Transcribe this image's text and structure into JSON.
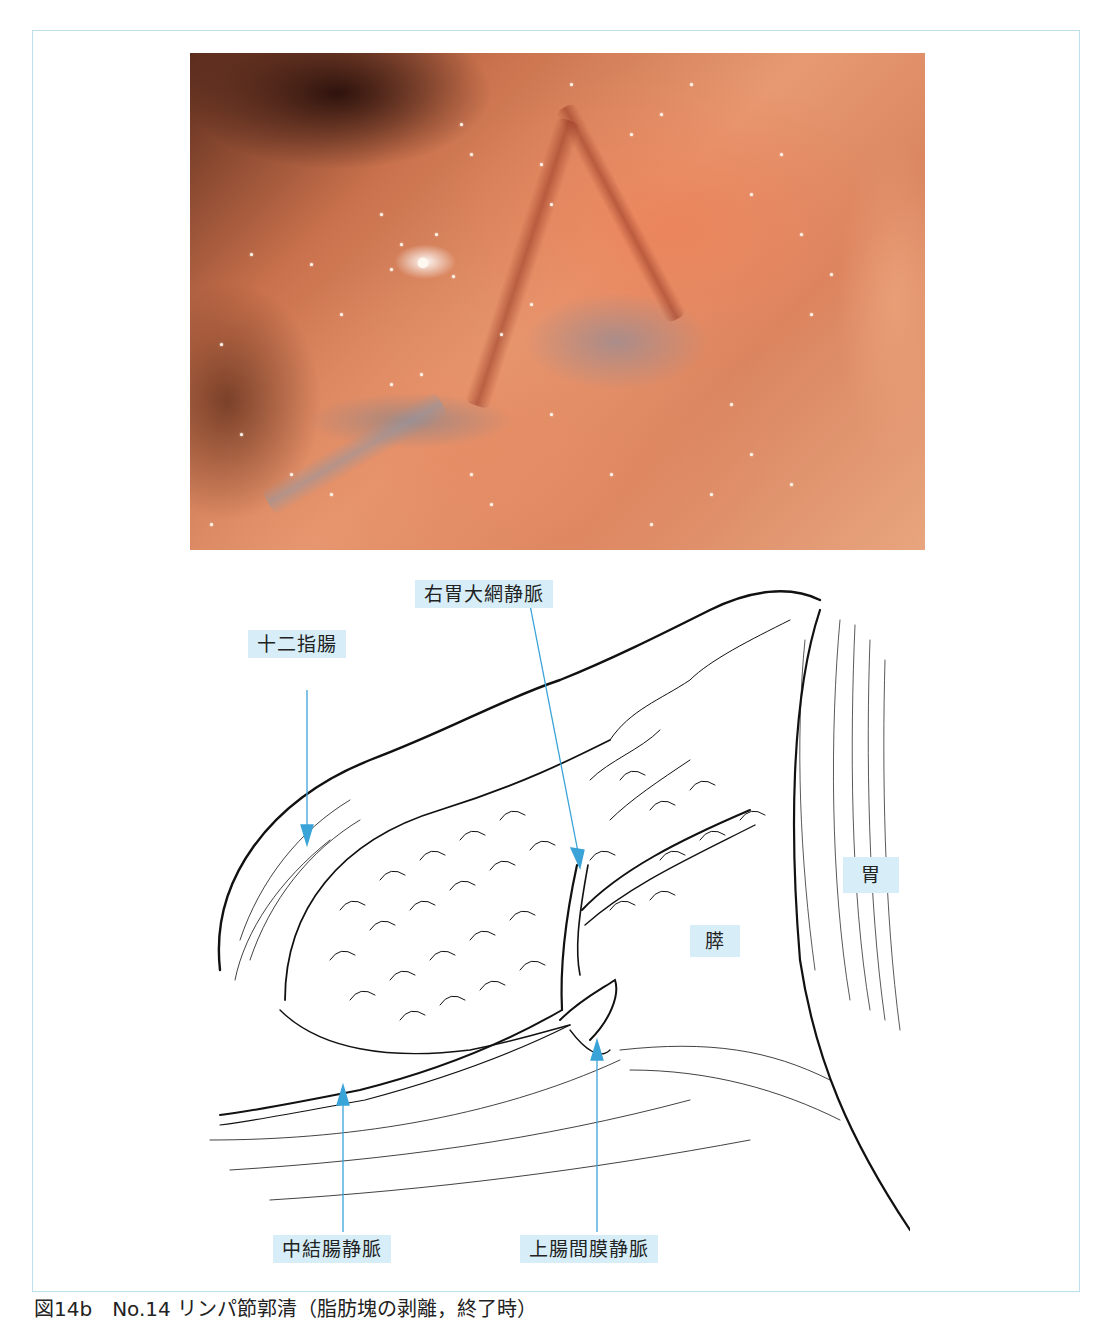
{
  "figure": {
    "caption": "図14b　No.14 リンパ節郭清（脂肪塊の剥離，終了時）",
    "photo": {
      "description": "laparoscopic-surgery-photo"
    },
    "illustration": {
      "labels": {
        "right_gastroepiploic_vein": "右胃大網静脈",
        "duodenum": "十二指腸",
        "stomach": "胃",
        "pancreas": "膵",
        "middle_colic_vein": "中結腸静脈",
        "superior_mesenteric_vein": "上腸間膜静脈"
      }
    },
    "colors": {
      "label_background": "#d7eef8",
      "arrow": "#3aa3d8",
      "frame_border": "#bfe0ee",
      "line_art": "#111111"
    }
  }
}
